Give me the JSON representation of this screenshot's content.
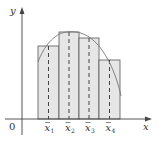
{
  "diagram": {
    "axes": {
      "x_label": "x",
      "y_label": "y",
      "origin_label": "0"
    },
    "midpoints": [
      {
        "base": "x",
        "sub": "1"
      },
      {
        "base": "x",
        "sub": "2"
      },
      {
        "base": "x",
        "sub": "3"
      },
      {
        "base": "x",
        "sub": "4"
      }
    ],
    "colors": {
      "bar_fill": "#e6e6e6",
      "stroke": "#555555",
      "curve": "#777777",
      "axis": "#444444"
    }
  }
}
